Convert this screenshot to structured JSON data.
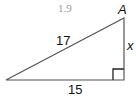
{
  "problem_number": "1.9",
  "diagram": {
    "type": "right-triangle",
    "vertex_label": "A",
    "hypotenuse_label": "17",
    "base_label": "15",
    "height_label": "x",
    "right_angle_marker": true,
    "colors": {
      "lines": "#555555",
      "marker": "#222222",
      "text": "#111111",
      "problem_number": "#9a9a9a"
    }
  }
}
